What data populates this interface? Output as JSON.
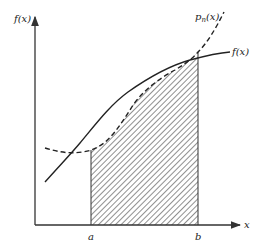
{
  "diagram": {
    "type": "definite-integral-approximation",
    "y_axis_label": "f(x)",
    "x_axis_label": "x",
    "curves": [
      {
        "name": "f(x)",
        "label": "f(x)",
        "style": "solid"
      },
      {
        "name": "p_n(x)",
        "label": "p",
        "subscript": "n",
        "label_suffix": "(x)",
        "style": "dashed"
      }
    ],
    "interval": {
      "start_label": "a",
      "end_label": "b"
    },
    "shaded_region": "area under p_n(x) from a to b (hatched)",
    "colors": {
      "ink": "#222222",
      "background": "#ffffff"
    }
  }
}
